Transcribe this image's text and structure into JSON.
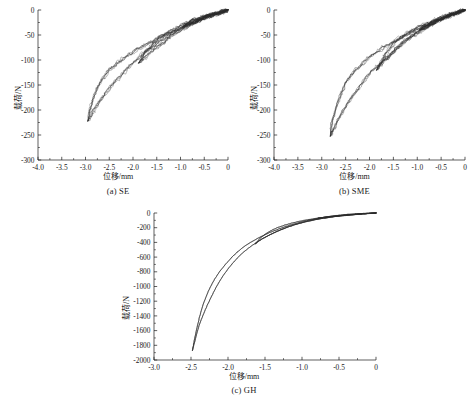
{
  "figure": {
    "panels": [
      {
        "key": "se",
        "caption": "(a) SE",
        "xlabel": "位移/mm",
        "ylabel": "载荷/N",
        "xlim": [
          -4.0,
          0.0
        ],
        "ylim": [
          -300,
          0
        ],
        "xticks": [
          -4.0,
          -3.5,
          -3.0,
          -2.5,
          -2.0,
          -1.5,
          -1.0,
          -0.5,
          0
        ],
        "xticklabels": [
          "-4.0",
          "-3.5",
          "-3.0",
          "-2.5",
          "-2.0",
          "-1.5",
          "-1.0",
          "-0.5",
          "0"
        ],
        "yticks": [
          0,
          -50,
          -100,
          -150,
          -200,
          -250,
          -300
        ],
        "yticklabels": [
          "0",
          "-50",
          "-100",
          "-150",
          "-200",
          "-250",
          "-300"
        ],
        "noise": 2.2,
        "line_color": "#2b2b2b"
      },
      {
        "key": "sme",
        "caption": "(b) SME",
        "xlabel": "位移/mm",
        "ylabel": "载荷/N",
        "xlim": [
          -4.0,
          0.0
        ],
        "ylim": [
          -300,
          0
        ],
        "xticks": [
          -4.0,
          -3.5,
          -3.0,
          -2.5,
          -2.0,
          -1.5,
          -1.0,
          -0.5,
          0
        ],
        "xticklabels": [
          "-4.0",
          "-3.5",
          "-3.0",
          "-2.5",
          "-2.0",
          "-1.5",
          "-1.0",
          "-0.5",
          "0"
        ],
        "yticks": [
          0,
          -50,
          -100,
          -150,
          -200,
          -250,
          -300
        ],
        "yticklabels": [
          "0",
          "-50",
          "-100",
          "-150",
          "-200",
          "-250",
          "-300"
        ],
        "noise": 2.2,
        "line_color": "#2b2b2b"
      },
      {
        "key": "gh",
        "caption": "(c) GH",
        "xlabel": "位移/mm",
        "ylabel": "载荷/N",
        "xlim": [
          -3.0,
          0.0
        ],
        "ylim": [
          -2000,
          0
        ],
        "xticks": [
          -3.0,
          -2.5,
          -2.0,
          -1.5,
          -1.0,
          -0.5,
          0
        ],
        "xticklabels": [
          "-3.0",
          "-2.5",
          "-2.0",
          "-1.5",
          "-1.0",
          "-0.5",
          "0"
        ],
        "yticks": [
          0,
          -200,
          -400,
          -600,
          -800,
          -1000,
          -1200,
          -1400,
          -1600,
          -1800,
          -2000
        ],
        "yticklabels": [
          "0",
          "-200",
          "-400",
          "-600",
          "-800",
          "-1000",
          "-1200",
          "-1400",
          "-1600",
          "-1800",
          "-2000"
        ],
        "noise": 0.0,
        "line_color": "#2b2b2b"
      }
    ]
  },
  "chart_data": [
    {
      "type": "line",
      "panel": "(a) SE",
      "title": "",
      "xlabel": "位移/mm",
      "ylabel": "载荷/N",
      "xlim": [
        -4.0,
        0.0
      ],
      "ylim": [
        -300,
        0
      ],
      "grid": false,
      "legend": "none",
      "description": "Cyclic compressive load-displacement hysteresis loops, superelastic (SE) specimen; three nested loading-unloading cycles with residual noise on traces.",
      "series": [
        {
          "name": "cycle-1-load",
          "x": [
            0,
            -0.12,
            -0.28,
            -0.45,
            -0.62,
            -0.8,
            -0.95
          ],
          "y": [
            0,
            -4,
            -9,
            -14,
            -20,
            -27,
            -34
          ]
        },
        {
          "name": "cycle-1-unload",
          "x": [
            -0.95,
            -0.8,
            -0.6,
            -0.42,
            -0.25,
            -0.1,
            0
          ],
          "y": [
            -34,
            -24,
            -16,
            -10,
            -6,
            -2,
            0
          ]
        },
        {
          "name": "cycle-2-load",
          "x": [
            0,
            -0.25,
            -0.55,
            -0.85,
            -1.15,
            -1.45,
            -1.7,
            -1.88
          ],
          "y": [
            0,
            -8,
            -19,
            -33,
            -50,
            -70,
            -90,
            -106
          ]
        },
        {
          "name": "cycle-2-unload",
          "x": [
            -1.88,
            -1.7,
            -1.45,
            -1.18,
            -0.9,
            -0.62,
            -0.38,
            -0.18,
            0
          ],
          "y": [
            -106,
            -80,
            -57,
            -40,
            -27,
            -17,
            -10,
            -4,
            0
          ]
        },
        {
          "name": "cycle-3-load",
          "x": [
            0,
            -0.3,
            -0.65,
            -1.0,
            -1.35,
            -1.7,
            -2.05,
            -2.35,
            -2.62,
            -2.82,
            -2.95
          ],
          "y": [
            0,
            -9,
            -22,
            -38,
            -58,
            -82,
            -110,
            -142,
            -172,
            -200,
            -222
          ]
        },
        {
          "name": "cycle-3-unload",
          "x": [
            -2.95,
            -2.88,
            -2.72,
            -2.5,
            -2.22,
            -1.92,
            -1.6,
            -1.28,
            -0.95,
            -0.62,
            -0.32,
            0
          ],
          "y": [
            -222,
            -190,
            -150,
            -120,
            -98,
            -80,
            -63,
            -48,
            -34,
            -21,
            -10,
            0
          ]
        }
      ],
      "extrema": {
        "min_displacement_mm": -2.95,
        "min_load_N": -222
      }
    },
    {
      "type": "line",
      "panel": "(b) SME",
      "title": "",
      "xlabel": "位移/mm",
      "ylabel": "载荷/N",
      "xlim": [
        -4.0,
        0.0
      ],
      "ylim": [
        -300,
        0
      ],
      "grid": false,
      "legend": "none",
      "description": "Cyclic compressive load-displacement hysteresis loops, shape-memory-effect (SME) specimen; three nested cycles reaching a deeper peak load than SE.",
      "series": [
        {
          "name": "cycle-1-load",
          "x": [
            0,
            -0.12,
            -0.28,
            -0.45,
            -0.62,
            -0.8,
            -0.95
          ],
          "y": [
            0,
            -5,
            -11,
            -17,
            -24,
            -32,
            -40
          ]
        },
        {
          "name": "cycle-1-unload",
          "x": [
            -0.95,
            -0.78,
            -0.58,
            -0.4,
            -0.24,
            -0.1,
            0
          ],
          "y": [
            -40,
            -29,
            -19,
            -12,
            -7,
            -3,
            0
          ]
        },
        {
          "name": "cycle-2-load",
          "x": [
            0,
            -0.25,
            -0.55,
            -0.85,
            -1.15,
            -1.45,
            -1.68,
            -1.85
          ],
          "y": [
            0,
            -9,
            -21,
            -37,
            -56,
            -79,
            -100,
            -120
          ]
        },
        {
          "name": "cycle-2-unload",
          "x": [
            -1.85,
            -1.68,
            -1.45,
            -1.18,
            -0.9,
            -0.62,
            -0.38,
            -0.18,
            0
          ],
          "y": [
            -120,
            -92,
            -64,
            -45,
            -31,
            -20,
            -11,
            -5,
            0
          ]
        },
        {
          "name": "cycle-3-load",
          "x": [
            0,
            -0.3,
            -0.62,
            -0.95,
            -1.28,
            -1.6,
            -1.95,
            -2.25,
            -2.52,
            -2.72,
            -2.82
          ],
          "y": [
            0,
            -10,
            -24,
            -42,
            -64,
            -92,
            -124,
            -158,
            -196,
            -232,
            -252
          ]
        },
        {
          "name": "cycle-3-unload",
          "x": [
            -2.82,
            -2.75,
            -2.6,
            -2.4,
            -2.12,
            -1.82,
            -1.5,
            -1.18,
            -0.88,
            -0.58,
            -0.3,
            0
          ],
          "y": [
            -252,
            -214,
            -168,
            -132,
            -104,
            -82,
            -64,
            -48,
            -34,
            -21,
            -10,
            0
          ]
        }
      ],
      "extrema": {
        "min_displacement_mm": -2.82,
        "min_load_N": -252
      }
    },
    {
      "type": "line",
      "panel": "(c) GH",
      "title": "",
      "xlabel": "位移/mm",
      "ylabel": "载荷/N",
      "xlim": [
        -3.0,
        0.0
      ],
      "ylim": [
        -2000,
        0
      ],
      "grid": false,
      "legend": "none",
      "description": "Cyclic compressive load-displacement hysteresis loops, GH specimen; smooth traces with a much stiffer response reaching about -1870 N.",
      "series": [
        {
          "name": "cycle-1-load",
          "x": [
            0,
            -0.12,
            -0.28,
            -0.45,
            -0.62,
            -0.78
          ],
          "y": [
            0,
            -8,
            -20,
            -35,
            -52,
            -70
          ]
        },
        {
          "name": "cycle-1-unload",
          "x": [
            -0.78,
            -0.62,
            -0.45,
            -0.28,
            -0.12,
            0
          ],
          "y": [
            -70,
            -48,
            -31,
            -17,
            -6,
            0
          ]
        },
        {
          "name": "cycle-2-load",
          "x": [
            0,
            -0.28,
            -0.58,
            -0.88,
            -1.15,
            -1.38,
            -1.55,
            -1.63
          ],
          "y": [
            0,
            -20,
            -52,
            -102,
            -175,
            -270,
            -360,
            -420
          ]
        },
        {
          "name": "cycle-2-unload",
          "x": [
            -1.63,
            -1.55,
            -1.4,
            -1.2,
            -0.98,
            -0.72,
            -0.45,
            -0.2,
            0
          ],
          "y": [
            -420,
            -330,
            -230,
            -155,
            -102,
            -62,
            -32,
            -10,
            0
          ]
        },
        {
          "name": "cycle-3-load",
          "x": [
            0,
            -0.3,
            -0.62,
            -0.95,
            -1.25,
            -1.55,
            -1.82,
            -2.05,
            -2.22,
            -2.38,
            -2.48
          ],
          "y": [
            0,
            -22,
            -58,
            -120,
            -215,
            -360,
            -560,
            -830,
            -1130,
            -1500,
            -1870
          ]
        },
        {
          "name": "cycle-3-unload",
          "x": [
            -2.48,
            -2.42,
            -2.32,
            -2.18,
            -2.0,
            -1.8,
            -1.55,
            -1.28,
            -1.0,
            -0.7,
            -0.38,
            0
          ],
          "y": [
            -1870,
            -1560,
            -1200,
            -900,
            -660,
            -470,
            -320,
            -205,
            -120,
            -58,
            -18,
            0
          ]
        }
      ],
      "extrema": {
        "min_displacement_mm": -2.48,
        "min_load_N": -1870
      }
    }
  ]
}
